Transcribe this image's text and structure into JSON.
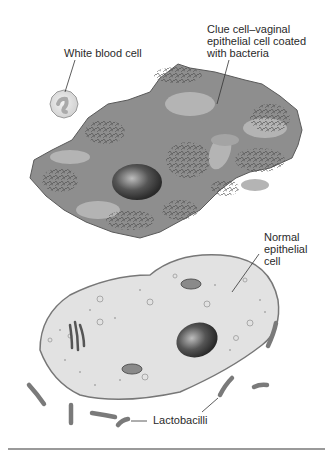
{
  "figure": {
    "labels": {
      "white_blood_cell": "White blood cell",
      "clue_cell": "Clue cell–vaginal\nepithelial cell coated\nwith bacteria",
      "normal_cell": "Normal\nepithelial\ncell",
      "lactobacilli": "Lactobacilli"
    },
    "colors": {
      "clue_cell_fill": "#8e8e8e",
      "clue_cell_patches": "#b4b4b4",
      "bacteria_clusters": "#555555",
      "normal_cell_fill": "#e2e2e2",
      "normal_cell_border": "#777777",
      "nucleus": "#3a3a3a",
      "lactobacilli": "#7a7a7a",
      "leader_lines": "#333333",
      "divider": "#9a9a9a"
    }
  }
}
